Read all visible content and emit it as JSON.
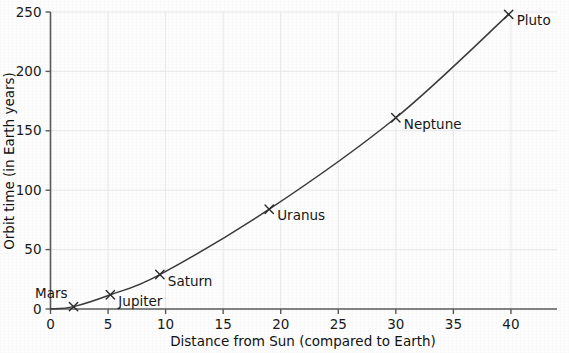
{
  "chart_data": {
    "type": "line",
    "title": "",
    "subtitle": "",
    "xlabel": "Distance from Sun (compared to Earth)",
    "ylabel": "Orbit time (in Earth years)",
    "xlim": [
      0,
      44
    ],
    "ylim": [
      0,
      250
    ],
    "xticks": [
      0,
      5,
      10,
      15,
      20,
      25,
      30,
      35,
      40
    ],
    "yticks": [
      0,
      50,
      100,
      150,
      200,
      250
    ],
    "xtick_labels": [
      "0",
      "5",
      "10",
      "15",
      "20",
      "25",
      "30",
      "35",
      "40"
    ],
    "ytick_labels": [
      "0",
      "50",
      "100",
      "150",
      "200",
      "250"
    ],
    "grid": true,
    "grid_color": "#e9e9ec",
    "legend": "none",
    "marker_style": "x",
    "line_color": "#3a3a3a",
    "points": [
      {
        "label": "Mars",
        "x": 2.0,
        "y": 2,
        "label_pos": "above-left"
      },
      {
        "label": "Jupiter",
        "x": 5.2,
        "y": 12,
        "label_pos": "right"
      },
      {
        "label": "Saturn",
        "x": 9.5,
        "y": 29,
        "label_pos": "right"
      },
      {
        "label": "Uranus",
        "x": 19.0,
        "y": 84,
        "label_pos": "right"
      },
      {
        "label": "Neptune",
        "x": 30.0,
        "y": 161,
        "label_pos": "right"
      },
      {
        "label": "Pluto",
        "x": 39.8,
        "y": 248,
        "label_pos": "right"
      }
    ],
    "series": [
      {
        "name": "Orbit time vs distance",
        "x": [
          2.0,
          5.2,
          9.5,
          19.0,
          30.0,
          39.8
        ],
        "values": [
          2,
          12,
          29,
          84,
          161,
          248
        ]
      }
    ],
    "annotations": [
      "Mars",
      "Jupiter",
      "Saturn",
      "Uranus",
      "Neptune",
      "Pluto"
    ]
  }
}
